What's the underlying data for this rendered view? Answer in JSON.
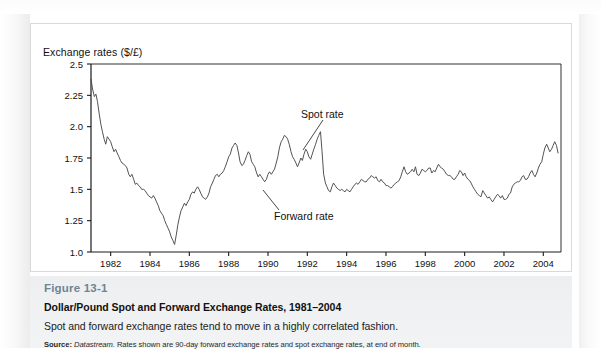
{
  "figure": {
    "number": "Figure 13-1",
    "title": "Dollar/Pound Spot and Forward Exchange Rates, 1981–2004",
    "description": "Spot and forward exchange rates tend to move in a highly correlated fashion.",
    "source_label": "Source:",
    "source_italic": "Datastream.",
    "source_rest": "Rates shown are 90-day forward exchange rates and spot exchange rates, at end of month."
  },
  "annotations": {
    "spot": "Spot rate",
    "forward": "Forward rate"
  },
  "colors": {
    "line": "#4a4a4a",
    "axis": "#1a1a1a",
    "figure_number": "#6d8594",
    "caption_bg": "#eef0f1",
    "panel_border": "#d9d9d9",
    "text": "#111111"
  },
  "chart_data": {
    "type": "line",
    "title": "Dollar/Pound Spot and Forward Exchange Rates, 1981–2004",
    "xlabel": "",
    "ylabel": "Exchange rates ($/£)",
    "ylim": [
      1.0,
      2.5
    ],
    "xlim": [
      1981.0,
      2004.9
    ],
    "yticks": [
      "1.0",
      "1.25",
      "1.5",
      "1.75",
      "2.0",
      "2.25",
      "2.5"
    ],
    "ytick_values": [
      1.0,
      1.25,
      1.5,
      1.75,
      2.0,
      2.25,
      2.5
    ],
    "xticks": [
      "1982",
      "1984",
      "1986",
      "1988",
      "1990",
      "1992",
      "1994",
      "1996",
      "1998",
      "2000",
      "2002",
      "2004"
    ],
    "xtick_values": [
      1982,
      1984,
      1986,
      1988,
      1990,
      1992,
      1994,
      1996,
      1998,
      2000,
      2002,
      2004
    ],
    "grid": false,
    "legend": "none",
    "annotations": [
      {
        "text": "Spot rate",
        "x": 1991.3,
        "y": 2.08
      },
      {
        "text": "Forward rate",
        "x": 1990.4,
        "y": 1.43
      }
    ],
    "series": [
      {
        "name": "Spot rate",
        "note": "Spot and forward rates nearly coincide at this scale; a single visible trace is drawn.",
        "x": [
          1981.0,
          1981.08,
          1981.17,
          1981.25,
          1981.33,
          1981.42,
          1981.5,
          1981.58,
          1981.67,
          1981.75,
          1981.83,
          1981.92,
          1982.0,
          1982.08,
          1982.17,
          1982.25,
          1982.33,
          1982.42,
          1982.5,
          1982.58,
          1982.67,
          1982.75,
          1982.83,
          1982.92,
          1983.0,
          1983.08,
          1983.17,
          1983.25,
          1983.33,
          1983.42,
          1983.5,
          1983.58,
          1983.67,
          1983.75,
          1983.83,
          1983.92,
          1984.0,
          1984.08,
          1984.17,
          1984.25,
          1984.33,
          1984.42,
          1984.5,
          1984.58,
          1984.67,
          1984.75,
          1984.83,
          1984.92,
          1985.0,
          1985.08,
          1985.17,
          1985.25,
          1985.33,
          1985.42,
          1985.5,
          1985.58,
          1985.67,
          1985.75,
          1985.83,
          1985.92,
          1986.0,
          1986.08,
          1986.17,
          1986.25,
          1986.33,
          1986.42,
          1986.5,
          1986.58,
          1986.67,
          1986.75,
          1986.83,
          1986.92,
          1987.0,
          1987.08,
          1987.17,
          1987.25,
          1987.33,
          1987.42,
          1987.5,
          1987.58,
          1987.67,
          1987.75,
          1987.83,
          1987.92,
          1988.0,
          1988.08,
          1988.17,
          1988.25,
          1988.33,
          1988.42,
          1988.5,
          1988.58,
          1988.67,
          1988.75,
          1988.83,
          1988.92,
          1989.0,
          1989.08,
          1989.17,
          1989.25,
          1989.33,
          1989.42,
          1989.5,
          1989.58,
          1989.67,
          1989.75,
          1989.83,
          1989.92,
          1990.0,
          1990.08,
          1990.17,
          1990.25,
          1990.33,
          1990.42,
          1990.5,
          1990.58,
          1990.67,
          1990.75,
          1990.83,
          1990.92,
          1991.0,
          1991.08,
          1991.17,
          1991.25,
          1991.33,
          1991.42,
          1991.5,
          1991.58,
          1991.67,
          1991.75,
          1991.83,
          1991.92,
          1992.0,
          1992.08,
          1992.17,
          1992.25,
          1992.33,
          1992.42,
          1992.5,
          1992.58,
          1992.67,
          1992.75,
          1992.83,
          1992.92,
          1993.0,
          1993.08,
          1993.17,
          1993.25,
          1993.33,
          1993.42,
          1993.5,
          1993.58,
          1993.67,
          1993.75,
          1993.83,
          1993.92,
          1994.0,
          1994.08,
          1994.17,
          1994.25,
          1994.33,
          1994.42,
          1994.5,
          1994.58,
          1994.67,
          1994.75,
          1994.83,
          1994.92,
          1995.0,
          1995.08,
          1995.17,
          1995.25,
          1995.33,
          1995.42,
          1995.5,
          1995.58,
          1995.67,
          1995.75,
          1995.83,
          1995.92,
          1996.0,
          1996.08,
          1996.17,
          1996.25,
          1996.33,
          1996.42,
          1996.5,
          1996.58,
          1996.67,
          1996.75,
          1996.83,
          1996.92,
          1997.0,
          1997.08,
          1997.17,
          1997.25,
          1997.33,
          1997.42,
          1997.5,
          1997.58,
          1997.67,
          1997.75,
          1997.83,
          1997.92,
          1998.0,
          1998.08,
          1998.17,
          1998.25,
          1998.33,
          1998.42,
          1998.5,
          1998.58,
          1998.67,
          1998.75,
          1998.83,
          1998.92,
          1999.0,
          1999.08,
          1999.17,
          1999.25,
          1999.33,
          1999.42,
          1999.5,
          1999.58,
          1999.67,
          1999.75,
          1999.83,
          1999.92,
          2000.0,
          2000.08,
          2000.17,
          2000.25,
          2000.33,
          2000.42,
          2000.5,
          2000.58,
          2000.67,
          2000.75,
          2000.83,
          2000.92,
          2001.0,
          2001.08,
          2001.17,
          2001.25,
          2001.33,
          2001.42,
          2001.5,
          2001.58,
          2001.67,
          2001.75,
          2001.83,
          2001.92,
          2002.0,
          2002.08,
          2002.17,
          2002.25,
          2002.33,
          2002.42,
          2002.5,
          2002.58,
          2002.67,
          2002.75,
          2002.83,
          2002.92,
          2003.0,
          2003.08,
          2003.17,
          2003.25,
          2003.33,
          2003.42,
          2003.5,
          2003.58,
          2003.67,
          2003.75,
          2003.83,
          2003.92,
          2004.0,
          2004.08,
          2004.17,
          2004.25,
          2004.33,
          2004.42,
          2004.5,
          2004.58,
          2004.67,
          2004.75
        ],
        "y": [
          2.38,
          2.3,
          2.24,
          2.26,
          2.2,
          2.1,
          2.02,
          1.96,
          1.9,
          1.86,
          1.92,
          1.9,
          1.88,
          1.84,
          1.8,
          1.82,
          1.79,
          1.76,
          1.73,
          1.71,
          1.7,
          1.69,
          1.67,
          1.62,
          1.6,
          1.62,
          1.58,
          1.54,
          1.55,
          1.53,
          1.52,
          1.5,
          1.5,
          1.49,
          1.47,
          1.45,
          1.44,
          1.43,
          1.45,
          1.43,
          1.4,
          1.37,
          1.33,
          1.31,
          1.29,
          1.25,
          1.22,
          1.19,
          1.16,
          1.12,
          1.09,
          1.06,
          1.13,
          1.22,
          1.28,
          1.33,
          1.36,
          1.39,
          1.37,
          1.4,
          1.42,
          1.46,
          1.48,
          1.47,
          1.5,
          1.52,
          1.5,
          1.47,
          1.44,
          1.43,
          1.42,
          1.44,
          1.47,
          1.52,
          1.55,
          1.58,
          1.61,
          1.62,
          1.6,
          1.62,
          1.63,
          1.65,
          1.68,
          1.72,
          1.76,
          1.78,
          1.83,
          1.85,
          1.87,
          1.85,
          1.79,
          1.72,
          1.69,
          1.7,
          1.73,
          1.77,
          1.8,
          1.78,
          1.72,
          1.7,
          1.68,
          1.63,
          1.6,
          1.62,
          1.6,
          1.58,
          1.56,
          1.58,
          1.62,
          1.64,
          1.62,
          1.64,
          1.66,
          1.71,
          1.76,
          1.83,
          1.88,
          1.9,
          1.93,
          1.92,
          1.9,
          1.86,
          1.8,
          1.76,
          1.74,
          1.71,
          1.68,
          1.71,
          1.75,
          1.73,
          1.78,
          1.82,
          1.8,
          1.76,
          1.74,
          1.78,
          1.82,
          1.86,
          1.9,
          1.93,
          1.96,
          1.8,
          1.62,
          1.55,
          1.52,
          1.49,
          1.48,
          1.52,
          1.55,
          1.53,
          1.51,
          1.5,
          1.49,
          1.5,
          1.49,
          1.48,
          1.5,
          1.49,
          1.48,
          1.5,
          1.52,
          1.54,
          1.55,
          1.54,
          1.56,
          1.58,
          1.57,
          1.56,
          1.56,
          1.58,
          1.59,
          1.61,
          1.6,
          1.59,
          1.6,
          1.57,
          1.56,
          1.58,
          1.56,
          1.55,
          1.53,
          1.53,
          1.52,
          1.51,
          1.52,
          1.54,
          1.55,
          1.56,
          1.57,
          1.6,
          1.64,
          1.68,
          1.64,
          1.62,
          1.63,
          1.64,
          1.66,
          1.64,
          1.68,
          1.62,
          1.61,
          1.63,
          1.66,
          1.65,
          1.64,
          1.65,
          1.67,
          1.67,
          1.63,
          1.65,
          1.64,
          1.67,
          1.7,
          1.68,
          1.67,
          1.66,
          1.64,
          1.62,
          1.61,
          1.61,
          1.6,
          1.58,
          1.58,
          1.6,
          1.62,
          1.65,
          1.64,
          1.61,
          1.63,
          1.6,
          1.58,
          1.57,
          1.55,
          1.52,
          1.5,
          1.48,
          1.46,
          1.45,
          1.44,
          1.49,
          1.47,
          1.45,
          1.43,
          1.44,
          1.42,
          1.4,
          1.42,
          1.44,
          1.46,
          1.45,
          1.43,
          1.45,
          1.42,
          1.42,
          1.43,
          1.46,
          1.47,
          1.52,
          1.54,
          1.55,
          1.56,
          1.56,
          1.57,
          1.6,
          1.61,
          1.58,
          1.58,
          1.6,
          1.63,
          1.65,
          1.62,
          1.6,
          1.63,
          1.67,
          1.7,
          1.72,
          1.78,
          1.83,
          1.86,
          1.83,
          1.8,
          1.82,
          1.85,
          1.88,
          1.85,
          1.79
        ]
      }
    ]
  }
}
